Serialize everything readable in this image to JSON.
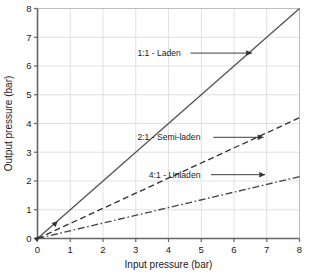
{
  "chart_data": {
    "type": "line",
    "title": "",
    "xlabel": "Input pressure (bar)",
    "ylabel": "Output pressure (bar)",
    "xlim": [
      0,
      8
    ],
    "ylim": [
      0,
      8
    ],
    "xticks": [
      "0",
      "1",
      "2",
      "3",
      "4",
      "5",
      "6",
      "7",
      "8"
    ],
    "yticks": [
      "0",
      "1",
      "2",
      "3",
      "4",
      "5",
      "6",
      "7",
      "8"
    ],
    "grid": true,
    "legend_position": "inline-annotations",
    "series": [
      {
        "name": "1:1 - Laden",
        "ratio": "1:1",
        "style": "solid",
        "color": "#555555",
        "x": [
          0,
          8
        ],
        "values": [
          0,
          8
        ],
        "slope": 1.0,
        "label": "1:1 - Laden",
        "label_x": 3.05,
        "label_y": 6.45,
        "leader_to_x": 6.55
      },
      {
        "name": "2:1 - Semi-laden",
        "ratio": "2:1",
        "style": "dashed",
        "color": "#333333",
        "x": [
          0,
          8
        ],
        "values": [
          0,
          4.2
        ],
        "slope": 0.525,
        "label": "2:1 - Semi-laden",
        "label_x": 3.05,
        "label_y": 3.52,
        "leader_to_x": 6.9
      },
      {
        "name": "4:1 - Unladen",
        "ratio": "4:1",
        "style": "dashdot",
        "color": "#444444",
        "x": [
          0,
          8
        ],
        "values": [
          0,
          2.15
        ],
        "slope": 0.269,
        "label": "4:1 - Unladen",
        "label_x": 3.4,
        "label_y": 2.22,
        "leader_to_x": 6.95
      }
    ],
    "origin_markers": [
      {
        "name": "origin-arrow-lower",
        "x": 0.07,
        "y": 0.08
      },
      {
        "name": "origin-arrow-upper",
        "x": 0.62,
        "y": 0.6
      }
    ]
  }
}
